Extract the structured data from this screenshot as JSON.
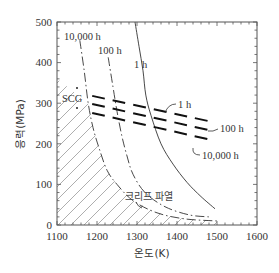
{
  "chart_data": {
    "type": "line",
    "title": "",
    "xlabel": "온도(K)",
    "ylabel": "응력(MPa)",
    "xlim": [
      1100,
      1600
    ],
    "ylim": [
      0,
      500
    ],
    "x_ticks": [
      1100,
      1200,
      1300,
      1400,
      1500,
      1600
    ],
    "y_ticks": [
      0,
      100,
      200,
      300,
      400,
      500
    ],
    "grid": false,
    "legend": "none (inline labels)",
    "regions": [
      {
        "name": "SCG",
        "label": "SCG",
        "description": "slow crack growth region (hatched)",
        "hatched": true
      },
      {
        "name": "creep-rupture",
        "label": "크리프 파열",
        "description": "creep rupture region"
      }
    ],
    "series": [
      {
        "name": "1 h creep-rupture",
        "style": "solid",
        "label": "1 h",
        "points": [
          [
            1295,
            500
          ],
          [
            1305,
            440
          ],
          [
            1315,
            380
          ],
          [
            1322,
            320
          ],
          [
            1335,
            270
          ],
          [
            1360,
            200
          ],
          [
            1390,
            150
          ],
          [
            1425,
            105
          ],
          [
            1460,
            70
          ],
          [
            1495,
            40
          ]
        ]
      },
      {
        "name": "100 h creep-rupture",
        "style": "dash-dot",
        "label": "100 h",
        "points": [
          [
            1228,
            413
          ],
          [
            1240,
            340
          ],
          [
            1250,
            280
          ],
          [
            1262,
            220
          ],
          [
            1275,
            170
          ],
          [
            1290,
            125
          ],
          [
            1320,
            80
          ],
          [
            1370,
            45
          ],
          [
            1430,
            25
          ],
          [
            1480,
            20
          ]
        ]
      },
      {
        "name": "10,000 h creep-rupture",
        "style": "dash-dot",
        "label": "10,000 h",
        "points": [
          [
            1157,
            455
          ],
          [
            1168,
            380
          ],
          [
            1178,
            300
          ],
          [
            1190,
            240
          ],
          [
            1205,
            190
          ],
          [
            1225,
            135
          ],
          [
            1250,
            100
          ],
          [
            1290,
            60
          ],
          [
            1350,
            30
          ],
          [
            1420,
            15
          ],
          [
            1500,
            10
          ]
        ]
      },
      {
        "name": "1 h SCG band",
        "style": "heavy-dash",
        "label": "1 h",
        "points": [
          [
            1188,
            318
          ],
          [
            1488,
            254
          ]
        ]
      },
      {
        "name": "100 h SCG band",
        "style": "heavy-dash",
        "label": "100 h",
        "points": [
          [
            1188,
            298
          ],
          [
            1488,
            232
          ]
        ]
      },
      {
        "name": "10,000 h SCG band",
        "style": "heavy-dash",
        "label": "10,000 h",
        "points": [
          [
            1188,
            276
          ],
          [
            1488,
            209
          ]
        ]
      }
    ],
    "annotations": [
      {
        "text": "10,000 h",
        "x": 1125,
        "y": 468
      },
      {
        "text": "100 h",
        "x": 1200,
        "y": 430
      },
      {
        "text": "1 h",
        "x": 1297,
        "y": 395
      },
      {
        "text": "SCG",
        "x": 1115,
        "y": 300
      },
      {
        "text": "1 h",
        "x": 1395,
        "y": 305
      },
      {
        "text": "100 h",
        "x": 1500,
        "y": 238
      },
      {
        "text": "10,000 h",
        "x": 1475,
        "y": 185
      },
      {
        "text": "크리프 파열",
        "x": 1315,
        "y": 75
      }
    ]
  },
  "labels": {
    "xlabel": "온도(K)",
    "ylabel": "응력(MPa)",
    "scg": "SCG",
    "creep": "크리프 파열",
    "l10000": "10,000 h",
    "l100": "100 h",
    "l1": "1 h",
    "r1": "1 h",
    "r100": "100 h",
    "r10000": "10,000 h",
    "x_ticks": [
      "1100",
      "1200",
      "1300",
      "1400",
      "1500",
      "1600"
    ],
    "y_ticks": [
      "0",
      "100",
      "200",
      "300",
      "400",
      "500"
    ]
  },
  "colors": {
    "axis": "#555555",
    "curve": "#333333",
    "band": "#111111",
    "hatch": "#777777"
  }
}
